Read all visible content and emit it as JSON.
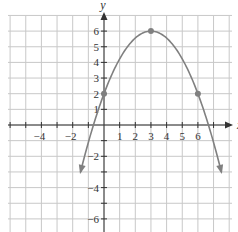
{
  "chart_data": {
    "type": "line",
    "title": "",
    "xlabel": "x",
    "ylabel": "y",
    "xlim": [
      -6,
      8
    ],
    "ylim": [
      -7,
      7
    ],
    "grid": true,
    "x_tick_labels": [
      "-4",
      "-2",
      "1",
      "2",
      "3",
      "4",
      "5",
      "6"
    ],
    "y_tick_labels": [
      "6",
      "5",
      "4",
      "3",
      "2",
      "1",
      "-2",
      "-4",
      "-6"
    ],
    "series": [
      {
        "name": "parabola",
        "equation": "y = -(4/9)(x - 3)^2 + 6",
        "vertex": [
          3,
          6
        ],
        "marked_points": [
          [
            0,
            2
          ],
          [
            3,
            6
          ],
          [
            6,
            2
          ]
        ],
        "x_range": [
          -1.5,
          7.5
        ],
        "color": "#808080"
      }
    ]
  },
  "colors": {
    "grid": "#c8c8c8",
    "axis": "#333333",
    "curve": "#808080"
  }
}
